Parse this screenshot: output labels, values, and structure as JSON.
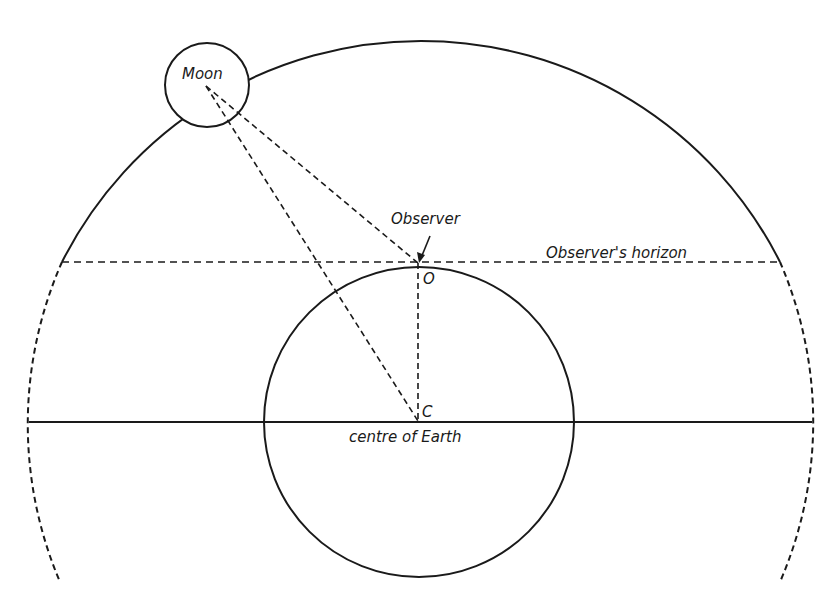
{
  "diagram": {
    "labels": {
      "moon": "Moon",
      "observer": "Observer",
      "horizon": "Observer's horizon",
      "point_o": "O",
      "point_c": "C",
      "centre": "centre of Earth"
    },
    "colors": {
      "ink": "#1a1a1a",
      "background": "#ffffff"
    }
  }
}
